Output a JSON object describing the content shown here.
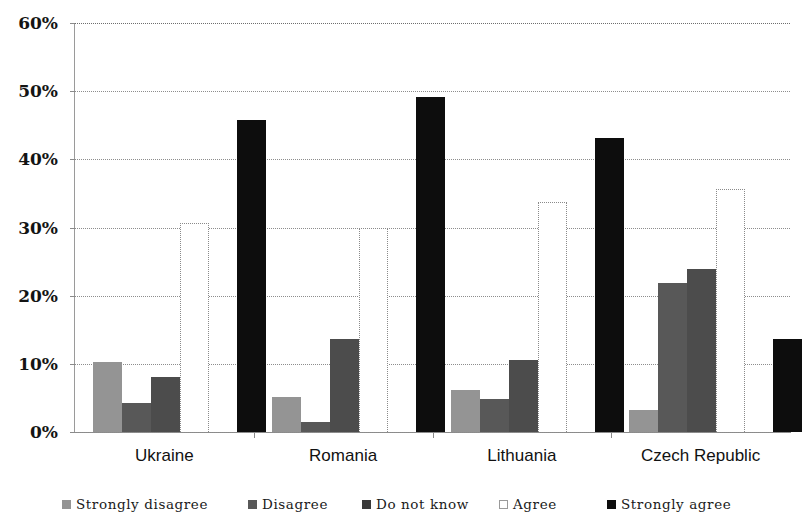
{
  "chart_data": {
    "type": "bar",
    "title": "",
    "subtitle": "",
    "xlabel": "",
    "ylabel": "",
    "categories": [
      "Ukraine",
      "Romania",
      "Lithuania",
      "Czech Republic"
    ],
    "series": [
      {
        "name": "Strongly disagree",
        "color": "#949494",
        "values": [
          10.2,
          5.2,
          6.1,
          3.3
        ]
      },
      {
        "name": "Disagree",
        "color": "#585858",
        "values": [
          4.2,
          1.5,
          4.9,
          21.8
        ]
      },
      {
        "name": "Do not know",
        "color": "#4c4c4c",
        "values": [
          8.1,
          13.7,
          10.6,
          23.9
        ]
      },
      {
        "name": "Agree",
        "color": "#ffffff",
        "values": [
          30.7,
          30.0,
          33.8,
          35.6
        ]
      },
      {
        "name": "Strongly agree",
        "color": "#0d0d0d",
        "values": [
          45.7,
          49.2,
          43.1,
          13.6
        ]
      }
    ],
    "ylim": [
      0,
      60
    ],
    "yticks": [
      0,
      10,
      20,
      30,
      40,
      50,
      60
    ],
    "ytick_labels": [
      "0%",
      "10%",
      "20%",
      "30%",
      "40%",
      "50%",
      "60%"
    ],
    "grid": true,
    "grid_style": "dotted-horizontal",
    "legend_position": "bottom",
    "legend_entries": [
      "Strongly disagree",
      "Disagree",
      "Do not know",
      "Agree",
      "Strongly agree"
    ],
    "bar_grouping": "clustered",
    "value_unit": "percent"
  },
  "axis": {
    "y_axis_color": "#9a9a9a",
    "x_axis_color": "#8a8a8a",
    "gridline_color": "#8d8d8d"
  },
  "legend": {
    "items": [
      {
        "label": "Strongly disagree",
        "swatch": "s1"
      },
      {
        "label": "Disagree",
        "swatch": "s2"
      },
      {
        "label": "Do not know",
        "swatch": "s3"
      },
      {
        "label": "Agree",
        "swatch": "s4"
      },
      {
        "label": "Strongly agree",
        "swatch": "s5"
      }
    ]
  }
}
